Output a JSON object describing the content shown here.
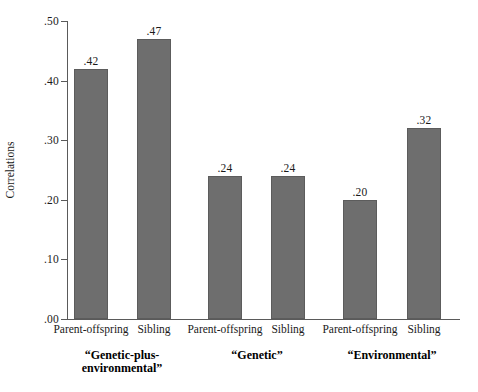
{
  "chart_data": {
    "type": "bar",
    "title": "",
    "xlabel": "",
    "ylabel": "Correlations",
    "ylim": [
      0.0,
      0.5
    ],
    "grid": false,
    "legend": "none",
    "ytick_labels": [
      ".50",
      ".40",
      ".30",
      ".20",
      ".10",
      ".00"
    ],
    "ytick_values": [
      0.5,
      0.4,
      0.3,
      0.2,
      0.1,
      0.0
    ],
    "categories": [
      "Parent-offspring",
      "Sibling",
      "Parent-offspring",
      "Sibling",
      "Parent-offspring",
      "Sibling"
    ],
    "values": [
      0.42,
      0.47,
      0.24,
      0.24,
      0.2,
      0.32
    ],
    "value_labels": [
      ".42",
      ".47",
      ".24",
      ".24",
      ".20",
      ".32"
    ],
    "bar_color": "#6e6e6e",
    "bar_edge_color": "#5c5c5c",
    "axis_color": "#5a5a5a",
    "groups": [
      {
        "label": "“Genetic-plus-\nenvironmental”",
        "center": 122.5
      },
      {
        "label": "“Genetic”",
        "center": 256.5
      },
      {
        "label": "“Environmental”",
        "center": 392.5
      }
    ],
    "bars": [
      {
        "value_label": ".42",
        "category": "Parent-offspring",
        "left": 74
      },
      {
        "value_label": ".47",
        "category": "Sibling",
        "left": 137
      },
      {
        "value_label": ".24",
        "category": "Parent-offspring",
        "left": 208
      },
      {
        "value_label": ".24",
        "category": "Sibling",
        "left": 271
      },
      {
        "value_label": ".20",
        "category": "Parent-offspring",
        "left": 343
      },
      {
        "value_label": ".32",
        "category": "Sibling",
        "left": 407
      }
    ]
  }
}
